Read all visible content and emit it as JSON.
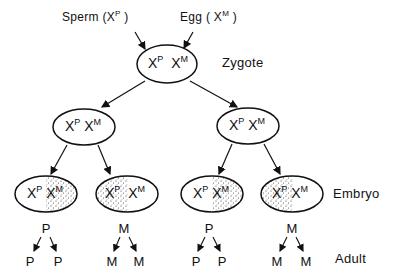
{
  "diagram": {
    "gametes": {
      "sperm": {
        "label": "Sperm",
        "chromosome": "X",
        "sup": "P"
      },
      "egg": {
        "label": "Egg",
        "chromosome": "X",
        "sup": "M"
      }
    },
    "stage_labels": {
      "zygote": "Zygote",
      "embryo": "Embryo",
      "adult": "Adult"
    },
    "zygote": {
      "left": "X",
      "left_sup": "P",
      "right": "X",
      "right_sup": "M"
    },
    "generation2": [
      {
        "left": "X",
        "left_sup": "P",
        "right": "X",
        "right_sup": "M"
      },
      {
        "left": "X",
        "left_sup": "P",
        "right": "X",
        "right_sup": "M"
      }
    ],
    "embryos": [
      {
        "left": "X",
        "left_sup": "P",
        "right": "X",
        "right_sup": "M",
        "inactivated": "M",
        "active_lineage": "P",
        "adult_cells": [
          "P",
          "P"
        ]
      },
      {
        "left": "X",
        "left_sup": "P",
        "right": "X",
        "right_sup": "M",
        "inactivated": "P",
        "active_lineage": "M",
        "adult_cells": [
          "M",
          "M"
        ]
      },
      {
        "left": "X",
        "left_sup": "P",
        "right": "X",
        "right_sup": "M",
        "inactivated": "M",
        "active_lineage": "P",
        "adult_cells": [
          "P",
          "P"
        ]
      },
      {
        "left": "X",
        "left_sup": "P",
        "right": "X",
        "right_sup": "M",
        "inactivated": "P",
        "active_lineage": "M",
        "adult_cells": [
          "M",
          "M"
        ]
      }
    ]
  }
}
